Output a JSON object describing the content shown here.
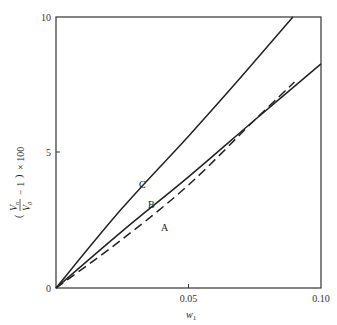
{
  "chart_data": {
    "type": "line",
    "title": "",
    "xlabel": "w₁",
    "ylabel": "(Vₙ/V₀ − 1) × 100",
    "xlim": [
      0,
      0.1
    ],
    "ylim": [
      0,
      10
    ],
    "xticks": [
      "0.05",
      "0.10"
    ],
    "yticks": [
      "0",
      "5",
      "10"
    ],
    "grid": false,
    "legend": "inline curve labels",
    "series": [
      {
        "name": "C",
        "style": "solid",
        "x": [
          0,
          0.025,
          0.05,
          0.07,
          0.0894
        ],
        "y": [
          0,
          2.95,
          5.6,
          7.8,
          10.0
        ]
      },
      {
        "name": "B",
        "style": "solid",
        "x": [
          0,
          0.025,
          0.05,
          0.075,
          0.1
        ],
        "y": [
          0,
          2.1,
          4.1,
          6.2,
          8.27
        ]
      },
      {
        "name": "A",
        "style": "dashed",
        "x": [
          0,
          0.025,
          0.05,
          0.075,
          0.09
        ],
        "y": [
          0,
          1.8,
          3.8,
          6.2,
          7.6
        ]
      }
    ]
  },
  "labels": {
    "y_title_main": "V",
    "y_title_n": "n",
    "y_title_0": "0",
    "y_title_rest": "− 1",
    "y_title_mult": "× 100",
    "x_title": "w",
    "x_title_sub": "1",
    "curve_a": "A",
    "curve_b": "B",
    "curve_c": "C",
    "tick_y0": "0",
    "tick_y5": "5",
    "tick_y10": "10",
    "tick_x005": "0.05",
    "tick_x010": "0.10"
  }
}
